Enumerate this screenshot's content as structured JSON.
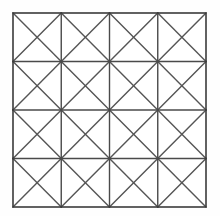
{
  "figure": {
    "canvas": {
      "width": 220,
      "height": 216,
      "background_color": "#fefefe"
    },
    "grid": {
      "rows": 4,
      "columns": 4,
      "cell_count": 16,
      "x_left": 13,
      "y_top": 13,
      "x_right": 206,
      "y_bottom": 207,
      "width": 193,
      "height": 194,
      "cell_width": 48.25,
      "cell_height": 48.5,
      "x_positions": [
        13,
        61.25,
        109.5,
        157.75,
        206
      ],
      "y_positions": [
        13,
        61.5,
        110,
        158.5,
        207
      ],
      "border_color": "#3b3b3b",
      "border_width": 1.6,
      "line_color": "#4a4a4a",
      "line_width": 1.4,
      "diagonal_color": "#555555",
      "diagonal_width": 1.4,
      "diagonals_per_cell": 2,
      "fill_color": "#ffffff"
    }
  }
}
